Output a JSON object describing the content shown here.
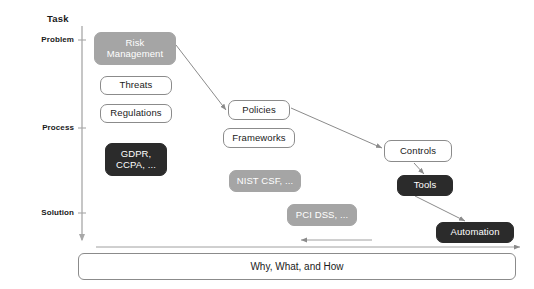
{
  "axis": {
    "title": "Task",
    "ticks": [
      {
        "label": "Problem",
        "y": 40
      },
      {
        "label": "Process",
        "y": 128
      },
      {
        "label": "Solution",
        "y": 213
      }
    ]
  },
  "nodes": [
    {
      "id": "risk-management",
      "label": "Risk\nManagement",
      "style": "gray",
      "x": 94,
      "y": 32,
      "w": 82,
      "h": 33,
      "font": 9.5
    },
    {
      "id": "threats",
      "label": "Threats",
      "style": "white",
      "x": 100,
      "y": 76,
      "w": 72,
      "h": 19,
      "font": 9.5
    },
    {
      "id": "regulations",
      "label": "Regulations",
      "style": "white",
      "x": 100,
      "y": 104,
      "w": 72,
      "h": 19,
      "font": 9.5
    },
    {
      "id": "gdpr-ccpa",
      "label": "GDPR,\nCCPA, ...",
      "style": "dark",
      "x": 105,
      "y": 143,
      "w": 62,
      "h": 33,
      "font": 9.5
    },
    {
      "id": "policies",
      "label": "Policies",
      "style": "white",
      "x": 228,
      "y": 100,
      "w": 62,
      "h": 20,
      "font": 9.5
    },
    {
      "id": "frameworks",
      "label": "Frameworks",
      "style": "white",
      "x": 223,
      "y": 128,
      "w": 72,
      "h": 20,
      "font": 9.5
    },
    {
      "id": "nist-csf",
      "label": "NIST CSF, ...",
      "style": "gray",
      "x": 229,
      "y": 170,
      "w": 72,
      "h": 22,
      "font": 9.5
    },
    {
      "id": "pci-dss",
      "label": "PCI DSS, ...",
      "style": "gray",
      "x": 287,
      "y": 204,
      "w": 70,
      "h": 22,
      "font": 9.5
    },
    {
      "id": "controls",
      "label": "Controls",
      "style": "white",
      "x": 384,
      "y": 140,
      "w": 68,
      "h": 22,
      "font": 9.5
    },
    {
      "id": "tools",
      "label": "Tools",
      "style": "dark",
      "x": 397,
      "y": 175,
      "w": 56,
      "h": 21,
      "font": 9.5
    },
    {
      "id": "automation",
      "label": "Automation",
      "style": "dark",
      "x": 436,
      "y": 222,
      "w": 78,
      "h": 21,
      "font": 9.5
    }
  ],
  "edges": [
    {
      "id": "risk-to-policies",
      "from": "risk-management",
      "to": "policies",
      "x1": 176,
      "y1": 45,
      "x2": 226,
      "y2": 110
    },
    {
      "id": "policies-to-controls",
      "from": "policies",
      "to": "controls",
      "x1": 291,
      "y1": 108,
      "x2": 382,
      "y2": 148
    },
    {
      "id": "controls-to-tools",
      "from": "controls",
      "to": "tools",
      "x1": 414,
      "y1": 163,
      "x2": 424,
      "y2": 174
    },
    {
      "id": "tools-to-automation",
      "from": "tools",
      "to": "automation",
      "x1": 415,
      "y1": 196,
      "x2": 465,
      "y2": 221
    }
  ],
  "flow_arrows": [
    {
      "id": "reverse-arrow",
      "direction": "left",
      "x1": 372,
      "y1": 240,
      "x2": 301,
      "y2": 240
    },
    {
      "id": "forward-arrow",
      "direction": "right",
      "x1": 96,
      "y1": 247,
      "x2": 520,
      "y2": 247
    }
  ],
  "bottom_bar": {
    "label": "Why, What, and How"
  },
  "colors": {
    "white_box_bg": "#ffffff",
    "white_box_border": "#8b8b8b",
    "gray_box_bg": "#a5a5a5",
    "dark_box_bg": "#2b2b2b",
    "text_dark": "#1a1a1a",
    "text_light": "#ffffff",
    "line": "#8b8b8b"
  }
}
